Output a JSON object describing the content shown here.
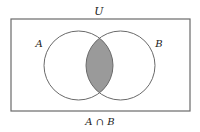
{
  "diagram": {
    "type": "venn",
    "universe_label": "U",
    "sets": [
      {
        "id": "A",
        "label": "A",
        "cx": 78.5,
        "cy": 65.5,
        "r": 34.5
      },
      {
        "id": "B",
        "label": "B",
        "cx": 120.5,
        "cy": 65.5,
        "r": 34.5
      }
    ],
    "shaded_region": "A ∩ B",
    "caption": "A ∩ B",
    "colors": {
      "outline": "#6a6a6a",
      "shade": "#9a9a9a",
      "background": "#ffffff",
      "text": "#222222"
    },
    "universe_box": {
      "x": 11,
      "y": 19,
      "width": 179,
      "height": 92
    }
  }
}
